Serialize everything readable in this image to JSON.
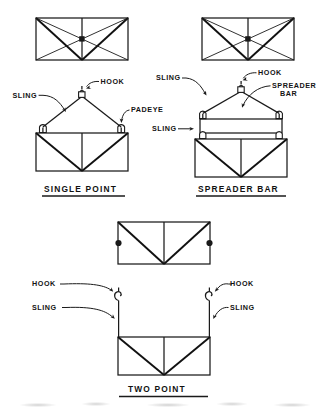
{
  "figure": {
    "background_color": "#ffffff",
    "line_color": "#1a1a1a"
  },
  "panels": [
    {
      "id": "single-point",
      "caption": "SINGLE POINT",
      "labels": [
        {
          "id": "hook",
          "text": "HOOK"
        },
        {
          "id": "sling",
          "text": "SLING"
        },
        {
          "id": "padeye",
          "text": "PADEYE"
        }
      ]
    },
    {
      "id": "spreader-bar",
      "caption": "SPREADER BAR",
      "labels": [
        {
          "id": "sling-upper",
          "text": "SLING"
        },
        {
          "id": "hook",
          "text": "HOOK"
        },
        {
          "id": "spreader-bar1",
          "text": "SPREADER"
        },
        {
          "id": "spreader-bar2",
          "text": "BAR"
        },
        {
          "id": "sling-lower",
          "text": "SLING"
        }
      ]
    },
    {
      "id": "two-point",
      "caption": "TWO POINT",
      "labels": [
        {
          "id": "hook-left",
          "text": "HOOK"
        },
        {
          "id": "sling-left",
          "text": "SLING"
        },
        {
          "id": "hook-right",
          "text": "HOOK"
        },
        {
          "id": "sling-right",
          "text": "SLING"
        }
      ]
    }
  ]
}
